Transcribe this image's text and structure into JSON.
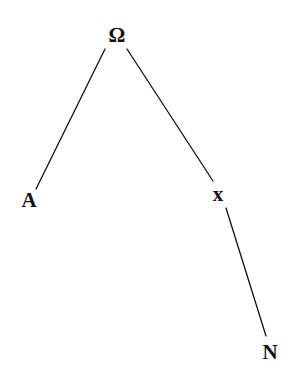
{
  "diagram": {
    "type": "tree",
    "nodes": [
      {
        "id": "root",
        "label": "Ω",
        "x": 117,
        "y": 35
      },
      {
        "id": "a",
        "label": "A",
        "x": 29,
        "y": 200
      },
      {
        "id": "x",
        "label": "x",
        "x": 218,
        "y": 194
      },
      {
        "id": "n",
        "label": "N",
        "x": 270,
        "y": 352
      }
    ],
    "edges": [
      {
        "from": "root",
        "to": "a",
        "x1": 105,
        "y1": 49,
        "x2": 36,
        "y2": 189
      },
      {
        "from": "root",
        "to": "x",
        "x1": 127,
        "y1": 49,
        "x2": 213,
        "y2": 181
      },
      {
        "from": "x",
        "to": "n",
        "x1": 226,
        "y1": 208,
        "x2": 266,
        "y2": 336
      }
    ],
    "colors": {
      "line": "#111111",
      "text": "#111111",
      "background": "#ffffff"
    }
  }
}
